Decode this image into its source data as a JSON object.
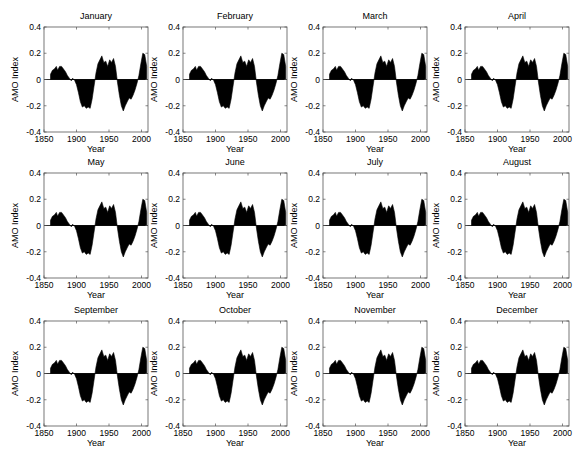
{
  "figure": {
    "ylabel": "AMO Index",
    "xlabel": "Year",
    "xticks": [
      1850,
      1900,
      1950,
      2000
    ],
    "yticks": [
      -0.4,
      -0.2,
      0,
      0.2,
      0.4
    ],
    "ytick_labels": [
      "-0.4",
      "-0.2",
      "0",
      "0.2",
      "0.4"
    ],
    "xlim": [
      1850,
      2010
    ],
    "ylim": [
      -0.4,
      0.4
    ],
    "fill_color": "#000000",
    "axes_color": "#555555"
  },
  "panels": [
    {
      "title": "January"
    },
    {
      "title": "February"
    },
    {
      "title": "March"
    },
    {
      "title": "April"
    },
    {
      "title": "May"
    },
    {
      "title": "June"
    },
    {
      "title": "July"
    },
    {
      "title": "August"
    },
    {
      "title": "September"
    },
    {
      "title": "October"
    },
    {
      "title": "November"
    },
    {
      "title": "December"
    }
  ],
  "chart_data": {
    "type": "area",
    "xlabel": "Year",
    "ylabel": "AMO Index",
    "xlim": [
      1850,
      2010
    ],
    "ylim": [
      -0.4,
      0.4
    ],
    "grid": false,
    "legend": null,
    "panels": [
      "January",
      "February",
      "March",
      "April",
      "May",
      "June",
      "July",
      "August",
      "September",
      "October",
      "November",
      "December"
    ],
    "x": [
      1860,
      1863,
      1866,
      1869,
      1871,
      1874,
      1877,
      1880,
      1883,
      1886,
      1889,
      1892,
      1894,
      1897,
      1900,
      1903,
      1906,
      1909,
      1912,
      1915,
      1918,
      1921,
      1924,
      1927,
      1930,
      1933,
      1936,
      1939,
      1942,
      1945,
      1948,
      1951,
      1954,
      1957,
      1960,
      1963,
      1966,
      1969,
      1972,
      1975,
      1978,
      1981,
      1984,
      1987,
      1990,
      1993,
      1996,
      1999,
      2002,
      2005,
      2008
    ],
    "values": [
      0.04,
      0.07,
      0.08,
      0.1,
      0.07,
      0.1,
      0.1,
      0.08,
      0.06,
      0.03,
      0.01,
      -0.01,
      0.01,
      -0.005,
      -0.04,
      -0.1,
      -0.17,
      -0.21,
      -0.2,
      -0.22,
      -0.21,
      -0.22,
      -0.15,
      -0.05,
      0.05,
      0.12,
      0.15,
      0.18,
      0.13,
      0.14,
      0.1,
      0.15,
      0.13,
      0.16,
      0.1,
      -0.02,
      -0.12,
      -0.2,
      -0.24,
      -0.2,
      -0.17,
      -0.14,
      -0.15,
      -0.12,
      -0.08,
      -0.03,
      0.03,
      0.12,
      0.2,
      0.19,
      0.1
    ],
    "note": "All twelve monthly panels show a nearly identical smoothed AMO curve filled to zero."
  }
}
